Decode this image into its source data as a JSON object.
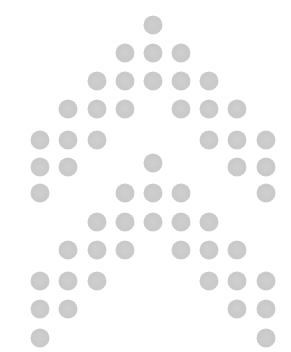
{
  "pattern": {
    "dot_color": "#cbcbcb",
    "background": "#ffffff",
    "dot_diameter": 19,
    "columns_x": [
      40,
      68,
      97,
      125,
      153,
      181,
      209,
      237,
      266
    ],
    "rows": [
      {
        "y": 25,
        "cols": [
          4
        ]
      },
      {
        "y": 53,
        "cols": [
          3,
          4,
          5
        ]
      },
      {
        "y": 81,
        "cols": [
          2,
          3,
          4,
          5,
          6
        ]
      },
      {
        "y": 109,
        "cols": [
          1,
          2,
          3,
          5,
          6,
          7
        ]
      },
      {
        "y": 140,
        "cols": [
          0,
          1,
          2,
          6,
          7,
          8
        ]
      },
      {
        "y": 167,
        "cols": [
          0,
          1,
          7,
          8
        ]
      },
      {
        "y": 163,
        "cols": [
          4
        ]
      },
      {
        "y": 193,
        "cols": [
          0,
          3,
          4,
          5,
          8
        ]
      },
      {
        "y": 222,
        "cols": [
          2,
          3,
          4,
          5,
          6
        ]
      },
      {
        "y": 250,
        "cols": [
          1,
          2,
          3,
          5,
          6,
          7
        ]
      },
      {
        "y": 281,
        "cols": [
          0,
          1,
          2,
          6,
          7,
          8
        ]
      },
      {
        "y": 309,
        "cols": [
          0,
          1,
          7,
          8
        ]
      },
      {
        "y": 338,
        "cols": [
          0,
          8
        ]
      }
    ]
  }
}
